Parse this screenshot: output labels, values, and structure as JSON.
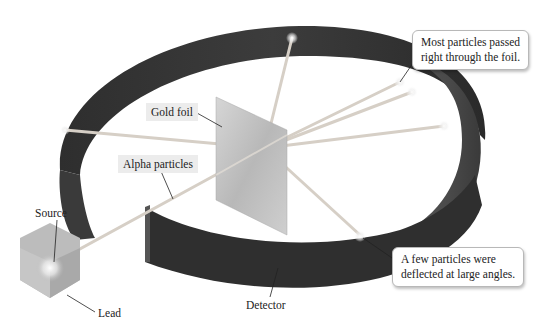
{
  "diagram": {
    "labels": {
      "source": "Source",
      "lead": "Lead",
      "alpha_particles": "Alpha particles",
      "gold_foil": "Gold foil",
      "detector": "Detector"
    },
    "callouts": {
      "most_particles": {
        "line1": "Most particles passed",
        "line2": "right through the foil."
      },
      "few_particles": {
        "line1": "A few particles were",
        "line2": "deflected at large angles."
      }
    },
    "colors": {
      "detector_ring": "#3a3a3a",
      "detector_inner": "#4a4a4a",
      "beam": "#d8d0c8",
      "foil": "#c8c8c8",
      "lead_block": "#b0b0b0",
      "callout_border": "#b8b8b8"
    }
  }
}
